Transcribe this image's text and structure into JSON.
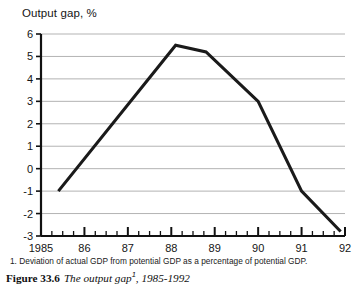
{
  "chart_data": {
    "type": "line",
    "title": "Output gap, %",
    "xlabel": "",
    "ylabel": "",
    "ylim": [
      -3,
      6
    ],
    "xlim": [
      1985,
      1992
    ],
    "grid": true,
    "legend": null,
    "y_ticks": [
      6,
      5,
      4,
      3,
      2,
      1,
      0,
      -1,
      -2,
      -3
    ],
    "x_ticks": [
      1985,
      1986,
      1987,
      1988,
      1989,
      1990,
      1991,
      1992
    ],
    "x_tick_labels": [
      "1985",
      "86",
      "87",
      "88",
      "89",
      "90",
      "91",
      "92"
    ],
    "x_minor_ticks_per_interval": 4,
    "series": [
      {
        "name": "Output gap",
        "x": [
          1985.4,
          1988.1,
          1988.8,
          1990.0,
          1991.0,
          1991.9
        ],
        "values": [
          -1.0,
          5.5,
          5.2,
          3.0,
          -1.0,
          -2.8
        ]
      }
    ],
    "line_color": "#1a1a1a",
    "grid_color": "#b3b3b3",
    "axis_color": "#111111"
  },
  "footnote": {
    "marker": "1.",
    "text": "Deviation of actual GDP from potential GDP as a percentage of potential GDP."
  },
  "caption": {
    "label": "Figure 33.6",
    "text": "The output gap",
    "superscript": "1",
    "suffix": ", 1985-1992"
  }
}
